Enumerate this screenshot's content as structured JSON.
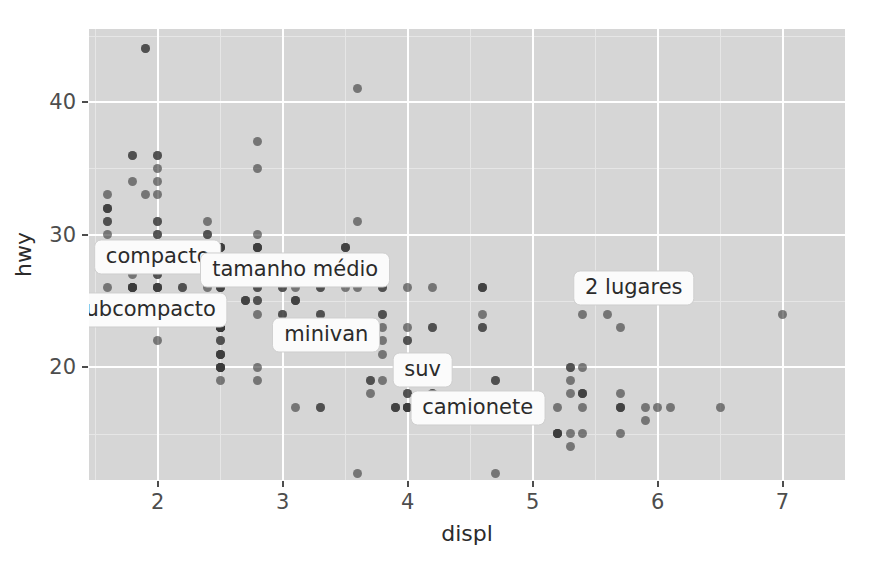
{
  "chart_data": {
    "type": "scatter",
    "title": "",
    "subtitle": "",
    "xlabel": "displ",
    "ylabel": "hwy",
    "xlim": [
      1.45,
      7.5
    ],
    "ylim": [
      11.5,
      45.5
    ],
    "xticks": [
      "2",
      "3",
      "4",
      "5",
      "6",
      "7"
    ],
    "xtick_values": [
      2,
      3,
      4,
      5,
      6,
      7
    ],
    "yticks": [
      "20",
      "30",
      "40"
    ],
    "ytick_values": [
      20,
      30,
      40
    ],
    "grid": true,
    "legend": "none",
    "point_color": "#3a3a3a",
    "point_opacity": 0.62,
    "panel_background": "#d6d6d6",
    "gridline_major_color": "#ffffff",
    "gridline_minor_color": "#e6e6e6",
    "annotations": [
      {
        "text": "compacto",
        "x": 2.0,
        "y": 28.3
      },
      {
        "text": "tamanho médio",
        "x": 3.1,
        "y": 27.3
      },
      {
        "text": "subcompacto",
        "x": 1.9,
        "y": 24.3
      },
      {
        "text": "minivan",
        "x": 3.35,
        "y": 22.4
      },
      {
        "text": "suv",
        "x": 4.12,
        "y": 19.8
      },
      {
        "text": "camionete",
        "x": 4.56,
        "y": 16.9
      },
      {
        "text": "2 lugares",
        "x": 5.81,
        "y": 26.0
      }
    ],
    "points": [
      [
        1.8,
        29
      ],
      [
        1.8,
        29
      ],
      [
        2.0,
        31
      ],
      [
        2.0,
        30
      ],
      [
        2.8,
        26
      ],
      [
        2.8,
        26
      ],
      [
        3.1,
        27
      ],
      [
        1.8,
        26
      ],
      [
        1.8,
        25
      ],
      [
        2.0,
        28
      ],
      [
        2.0,
        27
      ],
      [
        2.8,
        25
      ],
      [
        2.8,
        25
      ],
      [
        3.1,
        25
      ],
      [
        3.1,
        25
      ],
      [
        2.8,
        24
      ],
      [
        3.1,
        25
      ],
      [
        4.2,
        23
      ],
      [
        5.3,
        20
      ],
      [
        5.3,
        15
      ],
      [
        5.3,
        20
      ],
      [
        5.7,
        17
      ],
      [
        6.0,
        17
      ],
      [
        5.7,
        26
      ],
      [
        5.7,
        23
      ],
      [
        6.2,
        26
      ],
      [
        6.2,
        25
      ],
      [
        7.0,
        24
      ],
      [
        5.3,
        19
      ],
      [
        5.3,
        14
      ],
      [
        5.7,
        15
      ],
      [
        6.5,
        17
      ],
      [
        2.4,
        27
      ],
      [
        2.4,
        30
      ],
      [
        3.1,
        26
      ],
      [
        3.5,
        29
      ],
      [
        3.6,
        26
      ],
      [
        2.4,
        24
      ],
      [
        3.0,
        24
      ],
      [
        3.3,
        22
      ],
      [
        3.3,
        22
      ],
      [
        3.3,
        24
      ],
      [
        3.3,
        24
      ],
      [
        3.3,
        17
      ],
      [
        3.8,
        22
      ],
      [
        3.8,
        21
      ],
      [
        3.8,
        23
      ],
      [
        4.0,
        23
      ],
      [
        3.7,
        19
      ],
      [
        3.7,
        18
      ],
      [
        3.9,
        17
      ],
      [
        3.9,
        17
      ],
      [
        4.7,
        19
      ],
      [
        4.7,
        19
      ],
      [
        4.7,
        12
      ],
      [
        5.2,
        17
      ],
      [
        5.2,
        15
      ],
      [
        3.9,
        17
      ],
      [
        4.7,
        17
      ],
      [
        4.7,
        16
      ],
      [
        4.7,
        17
      ],
      [
        5.2,
        15
      ],
      [
        5.7,
        17
      ],
      [
        5.9,
        16
      ],
      [
        4.7,
        17
      ],
      [
        4.7,
        17
      ],
      [
        4.7,
        16
      ],
      [
        4.7,
        17
      ],
      [
        5.2,
        15
      ],
      [
        5.2,
        15
      ],
      [
        5.7,
        17
      ],
      [
        5.9,
        17
      ],
      [
        4.6,
        16
      ],
      [
        5.4,
        15
      ],
      [
        5.4,
        17
      ],
      [
        4.0,
        17
      ],
      [
        4.0,
        17
      ],
      [
        4.0,
        17
      ],
      [
        4.6,
        16
      ],
      [
        5.0,
        17
      ],
      [
        4.2,
        26
      ],
      [
        4.2,
        23
      ],
      [
        4.6,
        26
      ],
      [
        4.6,
        26
      ],
      [
        4.6,
        26
      ],
      [
        5.4,
        25
      ],
      [
        5.4,
        24
      ],
      [
        3.8,
        24
      ],
      [
        3.8,
        24
      ],
      [
        4.0,
        22
      ],
      [
        4.0,
        22
      ],
      [
        4.6,
        23
      ],
      [
        4.6,
        24
      ],
      [
        4.6,
        23
      ],
      [
        5.4,
        20
      ],
      [
        1.6,
        33
      ],
      [
        1.6,
        32
      ],
      [
        1.6,
        32
      ],
      [
        1.6,
        29
      ],
      [
        1.6,
        32
      ],
      [
        1.8,
        34
      ],
      [
        1.8,
        36
      ],
      [
        1.8,
        36
      ],
      [
        2.0,
        29
      ],
      [
        2.4,
        26
      ],
      [
        2.4,
        27
      ],
      [
        2.4,
        30
      ],
      [
        2.4,
        31
      ],
      [
        2.5,
        26
      ],
      [
        2.5,
        26
      ],
      [
        3.3,
        17
      ],
      [
        2.0,
        28
      ],
      [
        2.0,
        27
      ],
      [
        2.0,
        26
      ],
      [
        2.0,
        26
      ],
      [
        2.7,
        25
      ],
      [
        2.7,
        25
      ],
      [
        2.7,
        25
      ],
      [
        3.0,
        24
      ],
      [
        3.7,
        19
      ],
      [
        4.0,
        17
      ],
      [
        4.7,
        17
      ],
      [
        4.7,
        17
      ],
      [
        4.7,
        17
      ],
      [
        5.7,
        18
      ],
      [
        6.1,
        17
      ],
      [
        4.0,
        18
      ],
      [
        4.2,
        18
      ],
      [
        4.4,
        17
      ],
      [
        4.6,
        17
      ],
      [
        5.4,
        18
      ],
      [
        5.4,
        18
      ],
      [
        5.4,
        18
      ],
      [
        4.0,
        18
      ],
      [
        4.0,
        17
      ],
      [
        4.6,
        17
      ],
      [
        5.0,
        17
      ],
      [
        2.4,
        29
      ],
      [
        2.4,
        29
      ],
      [
        2.5,
        28
      ],
      [
        2.5,
        28
      ],
      [
        3.5,
        29
      ],
      [
        3.5,
        29
      ],
      [
        3.0,
        26
      ],
      [
        3.0,
        26
      ],
      [
        3.5,
        26
      ],
      [
        3.3,
        26
      ],
      [
        3.3,
        26
      ],
      [
        4.0,
        26
      ],
      [
        5.6,
        24
      ],
      [
        3.1,
        27
      ],
      [
        3.8,
        27
      ],
      [
        3.8,
        26
      ],
      [
        3.8,
        26
      ],
      [
        5.3,
        18
      ],
      [
        2.5,
        24
      ],
      [
        2.5,
        24
      ],
      [
        2.5,
        23
      ],
      [
        2.5,
        23
      ],
      [
        2.5,
        23
      ],
      [
        2.5,
        23
      ],
      [
        2.2,
        26
      ],
      [
        2.2,
        26
      ],
      [
        2.5,
        23
      ],
      [
        2.5,
        23
      ],
      [
        2.5,
        23
      ],
      [
        2.5,
        22
      ],
      [
        2.5,
        22
      ],
      [
        2.5,
        23
      ],
      [
        2.2,
        25
      ],
      [
        2.2,
        25
      ],
      [
        2.5,
        23
      ],
      [
        2.5,
        23
      ],
      [
        2.5,
        20
      ],
      [
        2.5,
        20
      ],
      [
        2.5,
        21
      ],
      [
        2.5,
        21
      ],
      [
        2.5,
        19
      ],
      [
        2.5,
        20
      ],
      [
        2.5,
        21
      ],
      [
        2.5,
        20
      ],
      [
        2.5,
        20
      ],
      [
        2.5,
        21
      ],
      [
        1.6,
        29
      ],
      [
        1.6,
        29
      ],
      [
        1.6,
        31
      ],
      [
        1.6,
        30
      ],
      [
        1.6,
        31
      ],
      [
        1.6,
        26
      ],
      [
        1.8,
        28
      ],
      [
        1.8,
        26
      ],
      [
        1.8,
        26
      ],
      [
        1.8,
        27
      ],
      [
        2.0,
        31
      ],
      [
        2.0,
        30
      ],
      [
        2.0,
        33
      ],
      [
        2.0,
        35
      ],
      [
        2.8,
        37
      ],
      [
        2.8,
        35
      ],
      [
        3.6,
        41
      ],
      [
        1.9,
        44
      ],
      [
        1.9,
        44
      ],
      [
        2.0,
        29
      ],
      [
        2.0,
        26
      ],
      [
        2.0,
        28
      ],
      [
        2.0,
        29
      ],
      [
        2.5,
        29
      ],
      [
        2.5,
        29
      ],
      [
        2.5,
        28
      ],
      [
        2.5,
        29
      ],
      [
        2.8,
        29
      ],
      [
        2.8,
        29
      ],
      [
        2.8,
        28
      ],
      [
        2.8,
        29
      ],
      [
        1.9,
        33
      ],
      [
        2.0,
        34
      ],
      [
        2.0,
        36
      ],
      [
        2.0,
        36
      ],
      [
        2.5,
        29
      ],
      [
        2.5,
        26
      ],
      [
        2.8,
        27
      ],
      [
        2.8,
        30
      ],
      [
        3.6,
        31
      ],
      [
        1.8,
        26
      ],
      [
        1.8,
        26
      ],
      [
        2.0,
        28
      ],
      [
        2.0,
        26
      ],
      [
        2.8,
        29
      ],
      [
        2.8,
        28
      ],
      [
        3.6,
        27
      ],
      [
        2.0,
        24
      ],
      [
        2.0,
        24
      ],
      [
        2.0,
        24
      ],
      [
        2.0,
        22
      ],
      [
        2.8,
        19
      ],
      [
        2.8,
        20
      ],
      [
        3.1,
        17
      ],
      [
        3.6,
        12
      ],
      [
        3.8,
        19
      ],
      [
        4.2,
        18
      ]
    ]
  }
}
